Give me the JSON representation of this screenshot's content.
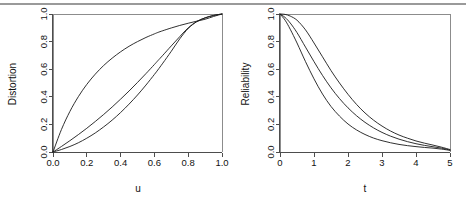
{
  "figure": {
    "name": "two-panel-distortion-reliability-figure",
    "top_rule_color": "#9a9a9a",
    "background_color": "#ffffff",
    "curve_color": "#1a1a1a",
    "axis_color": "#4d4d4d",
    "box_color": "#8c8c8c"
  },
  "chart_data": [
    {
      "type": "line",
      "panel": "left",
      "title": "",
      "xlabel": "u",
      "ylabel": "Distortion",
      "xlim": [
        0,
        1
      ],
      "ylim": [
        0,
        1
      ],
      "xticks": [
        0.0,
        0.2,
        0.4,
        0.6,
        0.8,
        1.0
      ],
      "xticklabels": [
        "0.0",
        "0.2",
        "0.4",
        "0.6",
        "0.8",
        "1.0"
      ],
      "yticks": [
        0.0,
        0.2,
        0.4,
        0.6,
        0.8,
        1.0
      ],
      "yticklabels": [
        "0.0",
        "0.2",
        "0.4",
        "0.6",
        "0.8",
        "1.0"
      ],
      "grid": false,
      "legend": "none",
      "x": [
        0.0,
        0.05,
        0.1,
        0.15,
        0.2,
        0.25,
        0.3,
        0.35,
        0.4,
        0.45,
        0.5,
        0.55,
        0.6,
        0.62,
        0.65,
        0.7,
        0.75,
        0.8,
        0.85,
        0.9,
        0.95,
        1.0
      ],
      "series": [
        {
          "name": "concave-distortion",
          "values": [
            0.0,
            0.163,
            0.294,
            0.401,
            0.49,
            0.564,
            0.627,
            0.68,
            0.726,
            0.766,
            0.8,
            0.83,
            0.856,
            0.866,
            0.879,
            0.899,
            0.917,
            0.933,
            0.948,
            0.962,
            0.982,
            1.0
          ]
        },
        {
          "name": "near-identity-distortion",
          "values": [
            0.0,
            0.04,
            0.082,
            0.126,
            0.172,
            0.221,
            0.272,
            0.326,
            0.383,
            0.442,
            0.504,
            0.568,
            0.634,
            0.661,
            0.701,
            0.769,
            0.836,
            0.9,
            0.945,
            0.972,
            0.989,
            1.0
          ]
        },
        {
          "name": "convex-distortion",
          "values": [
            0.0,
            0.018,
            0.04,
            0.067,
            0.1,
            0.138,
            0.182,
            0.231,
            0.286,
            0.347,
            0.413,
            0.485,
            0.562,
            0.594,
            0.644,
            0.73,
            0.82,
            0.895,
            0.944,
            0.972,
            0.99,
            1.0
          ]
        }
      ]
    },
    {
      "type": "line",
      "panel": "right",
      "title": "",
      "xlabel": "t",
      "ylabel": "Reliability",
      "xlim": [
        0,
        5
      ],
      "ylim": [
        0,
        1
      ],
      "xticks": [
        0,
        1,
        2,
        3,
        4,
        5
      ],
      "xticklabels": [
        "0",
        "1",
        "2",
        "3",
        "4",
        "5"
      ],
      "yticks": [
        0.0,
        0.2,
        0.4,
        0.6,
        0.8,
        1.0
      ],
      "yticklabels": [
        "0.0",
        "0.2",
        "0.4",
        "0.6",
        "0.8",
        "1.0"
      ],
      "grid": false,
      "legend": "none",
      "x": [
        0.0,
        0.15,
        0.3,
        0.5,
        0.75,
        1.0,
        1.25,
        1.5,
        1.75,
        2.0,
        2.25,
        2.5,
        2.75,
        3.0,
        3.25,
        3.5,
        3.75,
        4.0,
        4.25,
        4.5,
        4.75,
        5.0
      ],
      "series": [
        {
          "name": "heavy-tail-reliability",
          "values": [
            1.0,
            0.997,
            0.985,
            0.955,
            0.885,
            0.79,
            0.69,
            0.59,
            0.5,
            0.418,
            0.345,
            0.283,
            0.231,
            0.188,
            0.152,
            0.123,
            0.1,
            0.08,
            0.064,
            0.05,
            0.035,
            0.018
          ]
        },
        {
          "name": "mid-reliability",
          "values": [
            1.0,
            0.975,
            0.935,
            0.865,
            0.76,
            0.655,
            0.555,
            0.465,
            0.387,
            0.32,
            0.263,
            0.215,
            0.175,
            0.142,
            0.115,
            0.093,
            0.075,
            0.06,
            0.048,
            0.038,
            0.028,
            0.014
          ]
        },
        {
          "name": "fast-decay-reliability",
          "values": [
            1.0,
            0.955,
            0.89,
            0.79,
            0.655,
            0.53,
            0.42,
            0.33,
            0.26,
            0.203,
            0.16,
            0.127,
            0.101,
            0.082,
            0.067,
            0.055,
            0.046,
            0.039,
            0.033,
            0.028,
            0.021,
            0.012
          ]
        }
      ]
    }
  ],
  "left_panel": {
    "ylabel": "Distortion",
    "xlabel": "u",
    "xticklabels": [
      "0.0",
      "0.2",
      "0.4",
      "0.6",
      "0.8",
      "1.0"
    ],
    "yticklabels": [
      "0.0",
      "0.2",
      "0.4",
      "0.6",
      "0.8",
      "1.0"
    ]
  },
  "right_panel": {
    "ylabel": "Reliability",
    "xlabel": "t",
    "xticklabels": [
      "0",
      "1",
      "2",
      "3",
      "4",
      "5"
    ],
    "yticklabels": [
      "0.0",
      "0.2",
      "0.4",
      "0.6",
      "0.8",
      "1.0"
    ]
  }
}
